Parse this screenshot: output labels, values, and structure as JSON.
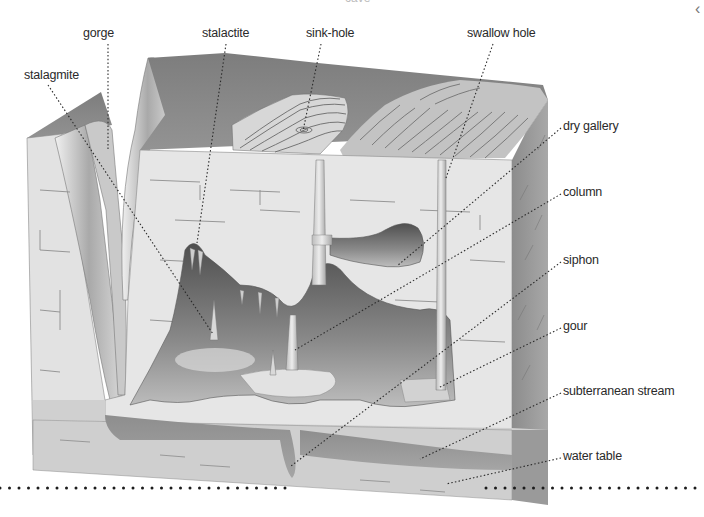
{
  "diagram": {
    "title_clipped": "cave",
    "nav": {
      "prev_icon": "‹"
    },
    "labels": [
      {
        "id": "gorge",
        "text": "gorge",
        "x": 83,
        "y": 33,
        "tx": 108,
        "ty": 150
      },
      {
        "id": "stalactite",
        "text": "stalactite",
        "x": 202,
        "y": 33,
        "tx": 197,
        "ty": 243
      },
      {
        "id": "sink-hole",
        "text": "sink-hole",
        "x": 306,
        "y": 33,
        "tx": 303,
        "ty": 131
      },
      {
        "id": "swallow-hole",
        "text": "swallow hole",
        "x": 467,
        "y": 33,
        "tx": 446,
        "ty": 178
      },
      {
        "id": "stalagmite",
        "text": "stalagmite",
        "x": 24,
        "y": 75,
        "tx": 213,
        "ty": 334
      },
      {
        "id": "dry-gallery",
        "text": "dry gallery",
        "x": 563,
        "y": 126,
        "tx": 397,
        "ty": 266
      },
      {
        "id": "column",
        "text": "column",
        "x": 563,
        "y": 192,
        "tx": 295,
        "ty": 350
      },
      {
        "id": "siphon",
        "text": "siphon",
        "x": 563,
        "y": 260,
        "tx": 291,
        "ty": 466
      },
      {
        "id": "gour",
        "text": "gour",
        "x": 563,
        "y": 326,
        "tx": 438,
        "ty": 388
      },
      {
        "id": "subterranean-stream",
        "text": "subterranean stream",
        "x": 563,
        "y": 391,
        "tx": 420,
        "ty": 459
      },
      {
        "id": "water-table",
        "text": "water table",
        "x": 563,
        "y": 456,
        "tx": 446,
        "ty": 484
      }
    ],
    "water_table_line": {
      "y": 488,
      "left_end": 288,
      "right_start": 486
    }
  },
  "colors": {
    "rock_face": "#e4e4e4",
    "rock_top": "#8a8a8a",
    "cave_dark": "#6e6e6e",
    "water": "#9a9a9a",
    "lines": "#2a2a2a"
  }
}
